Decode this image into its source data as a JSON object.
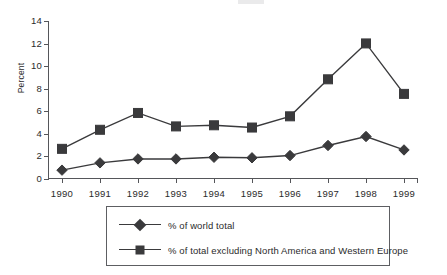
{
  "chart_data": {
    "type": "line",
    "title": "",
    "xlabel": "",
    "ylabel": "Percent",
    "categories": [
      "1990",
      "1991",
      "1992",
      "1993",
      "1994",
      "1995",
      "1996",
      "1997",
      "1998",
      "1999"
    ],
    "ylim": [
      0,
      14
    ],
    "yticks": [
      "0",
      "2",
      "4",
      "6",
      "8",
      "10",
      "12",
      "14"
    ],
    "grid": false,
    "legend_position": "bottom",
    "series": [
      {
        "name": "% of world total",
        "marker": "diamond",
        "values": [
          0.7,
          1.35,
          1.7,
          1.7,
          1.85,
          1.8,
          2.0,
          2.9,
          3.7,
          2.5
        ]
      },
      {
        "name": "% of total excluding North America and Western Europe",
        "marker": "square",
        "values": [
          2.6,
          4.3,
          5.8,
          4.6,
          4.7,
          4.5,
          5.5,
          8.8,
          12.0,
          7.5
        ]
      }
    ],
    "colors": {
      "series": "#3a3a3c",
      "axis": "#55565a",
      "text": "#2b2b2b",
      "background": "#ffffff"
    }
  }
}
